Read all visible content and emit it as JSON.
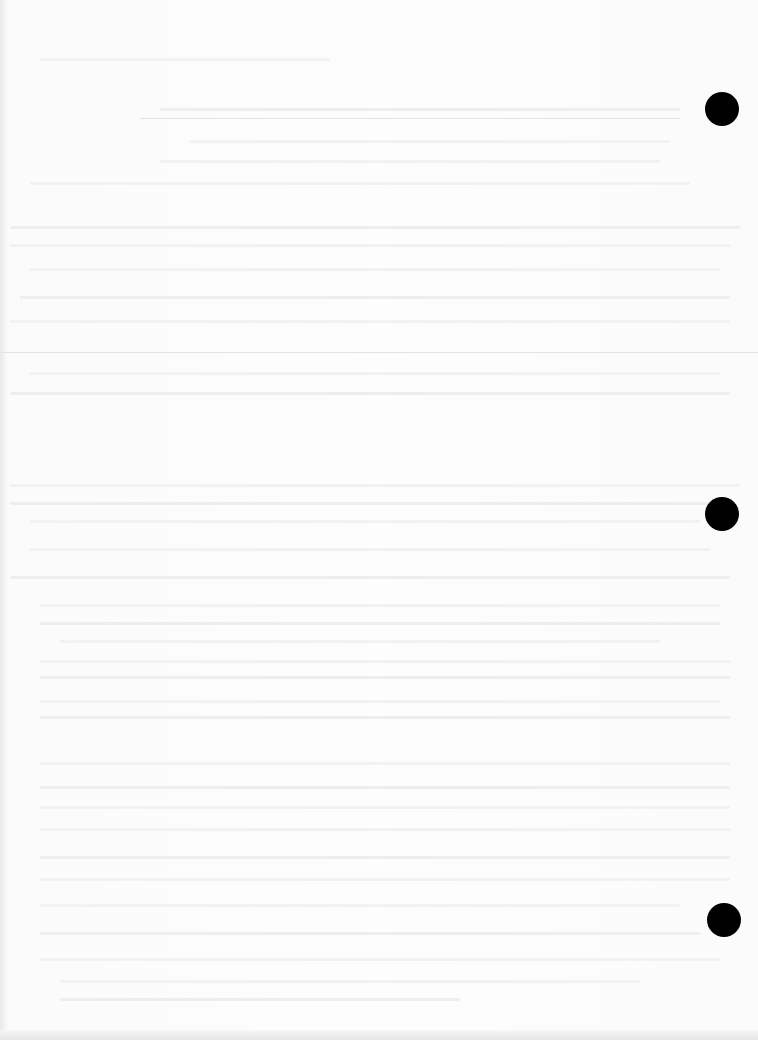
{
  "document": {
    "type": "scanned-page",
    "text_legible": false,
    "colors": {
      "paper": "#fdfdfd",
      "bleed_through": "#ececec",
      "edge_shade": "#e6e6e6",
      "punch_hole": "#000000"
    },
    "punch_holes": [
      {
        "cx": 722,
        "cy": 109
      },
      {
        "cx": 722,
        "cy": 514
      },
      {
        "cx": 724,
        "cy": 920
      }
    ]
  }
}
